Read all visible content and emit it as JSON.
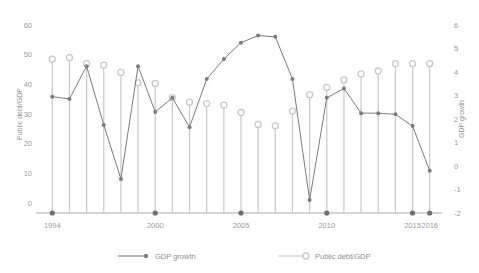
{
  "chart_data": {
    "type": "line",
    "title": "",
    "subtitle": "",
    "xlabel": "",
    "ylabel": "Public debt/GDP",
    "y2label": "GDP growth",
    "x": [
      1994,
      1995,
      1996,
      1997,
      1998,
      1999,
      2000,
      2001,
      2002,
      2003,
      2004,
      2005,
      2006,
      2007,
      2008,
      2009,
      2010,
      2011,
      2012,
      2013,
      2014,
      2015,
      2016
    ],
    "xticks": [
      1994,
      2000,
      2005,
      2010,
      2015,
      2016
    ],
    "xticklabels": [
      "1994",
      "2000",
      "2005",
      "2010",
      "2015",
      "2016"
    ],
    "xlim": [
      1993.4,
      2016.6
    ],
    "ylim": [
      0,
      60
    ],
    "yticks": [
      0,
      10,
      20,
      30,
      40,
      50,
      60
    ],
    "yticklabels": [
      "0",
      "10",
      "20",
      "30",
      "40",
      "50",
      "60"
    ],
    "y2lim": [
      -2,
      6
    ],
    "y2ticks": [
      -2,
      -1,
      0,
      1,
      2,
      3,
      4,
      5,
      6
    ],
    "y2ticklabels": [
      "-2",
      "-1",
      "0",
      "1",
      "2",
      "3",
      "4",
      "5",
      "6"
    ],
    "grid": false,
    "legend_position": "bottom",
    "series": [
      {
        "name": "GDP growth",
        "axis": "right",
        "marker": "filled-circle",
        "color": "#7c7c7c",
        "values": [
          2.95,
          2.85,
          4.25,
          1.75,
          -0.55,
          4.25,
          2.3,
          2.9,
          1.65,
          3.7,
          4.55,
          5.25,
          5.55,
          5.5,
          3.7,
          -1.45,
          2.9,
          3.3,
          2.25,
          2.25,
          2.2,
          1.7,
          -0.2
        ]
      },
      {
        "name": "Public debt/GDP",
        "axis": "left",
        "marker": "open-circle",
        "color": "#c9c9c9",
        "values": [
          48.5,
          49.0,
          47.0,
          46.5,
          44.0,
          40.5,
          40.3,
          35.5,
          34.0,
          33.5,
          33.0,
          30.5,
          26.5,
          26.0,
          31.0,
          36.5,
          39.0,
          41.5,
          43.5,
          44.5,
          47.0,
          47.0,
          47.0
        ]
      }
    ]
  },
  "legend": {
    "items": [
      {
        "label": "GDP growth",
        "marker": "filled-circle",
        "color": "#7c7c7c"
      },
      {
        "label": "Public debt/GDP",
        "marker": "open-circle",
        "color": "#c9c9c9"
      }
    ]
  },
  "axes": {
    "left_title": "Public debt/GDP",
    "right_title": "GDP growth"
  }
}
